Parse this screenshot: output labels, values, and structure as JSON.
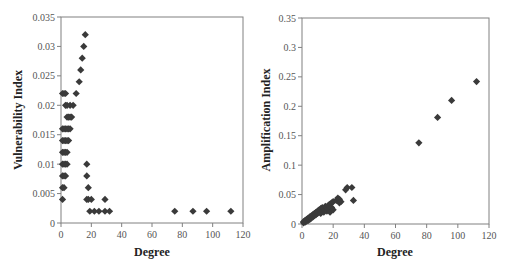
{
  "chart_data": [
    {
      "type": "scatter",
      "title": "",
      "xlabel": "Degree",
      "ylabel": "Vulnerability Index",
      "xlim": [
        0,
        120
      ],
      "ylim": [
        0,
        0.035
      ],
      "xticks": [
        "0",
        "20",
        "40",
        "60",
        "80",
        "100",
        "120"
      ],
      "yticks": [
        "0",
        "0.005",
        "0.01",
        "0.015",
        "0.02",
        "0.025",
        "0.03",
        "0.035"
      ],
      "grid": false,
      "legend": null,
      "marker": "diamond",
      "marker_color": "#3a3a3a",
      "series": [
        {
          "name": "Vulnerability Index",
          "points": [
            [
              16,
              0.032
            ],
            [
              15,
              0.03
            ],
            [
              14,
              0.028
            ],
            [
              13,
              0.026
            ],
            [
              12,
              0.024
            ],
            [
              1,
              0.022
            ],
            [
              2,
              0.022
            ],
            [
              3,
              0.022
            ],
            [
              10,
              0.022
            ],
            [
              3,
              0.02
            ],
            [
              4,
              0.02
            ],
            [
              6,
              0.02
            ],
            [
              8,
              0.02
            ],
            [
              4,
              0.018
            ],
            [
              5,
              0.018
            ],
            [
              6,
              0.018
            ],
            [
              7,
              0.018
            ],
            [
              1,
              0.016
            ],
            [
              2,
              0.016
            ],
            [
              3,
              0.016
            ],
            [
              4,
              0.016
            ],
            [
              5,
              0.016
            ],
            [
              6,
              0.016
            ],
            [
              1,
              0.014
            ],
            [
              2,
              0.014
            ],
            [
              3,
              0.014
            ],
            [
              4,
              0.014
            ],
            [
              5,
              0.014
            ],
            [
              1,
              0.012
            ],
            [
              2,
              0.012
            ],
            [
              3,
              0.012
            ],
            [
              4,
              0.012
            ],
            [
              1,
              0.01
            ],
            [
              2,
              0.01
            ],
            [
              3,
              0.01
            ],
            [
              4,
              0.01
            ],
            [
              17,
              0.01
            ],
            [
              1,
              0.008
            ],
            [
              2,
              0.008
            ],
            [
              3,
              0.008
            ],
            [
              17,
              0.008
            ],
            [
              1,
              0.006
            ],
            [
              2,
              0.006
            ],
            [
              18,
              0.006
            ],
            [
              1,
              0.004
            ],
            [
              17,
              0.004
            ],
            [
              18,
              0.004
            ],
            [
              20,
              0.004
            ],
            [
              29,
              0.004
            ],
            [
              19,
              0.002
            ],
            [
              22,
              0.002
            ],
            [
              25,
              0.002
            ],
            [
              29,
              0.002
            ],
            [
              32,
              0.002
            ],
            [
              75,
              0.002
            ],
            [
              87,
              0.002
            ],
            [
              96,
              0.002
            ],
            [
              112,
              0.002
            ]
          ]
        }
      ]
    },
    {
      "type": "scatter",
      "title": "",
      "xlabel": "Degree",
      "ylabel": "Amplification Index",
      "xlim": [
        0,
        120
      ],
      "ylim": [
        0,
        0.35
      ],
      "xticks": [
        "0",
        "20",
        "40",
        "60",
        "80",
        "100",
        "120"
      ],
      "yticks": [
        "0",
        "0.05",
        "0.1",
        "0.15",
        "0.2",
        "0.25",
        "0.3",
        "0.35"
      ],
      "grid": false,
      "legend": null,
      "marker": "diamond",
      "marker_color": "#3a3a3a",
      "series": [
        {
          "name": "Amplification Index",
          "points": [
            [
              1,
              0.002
            ],
            [
              1,
              0.004
            ],
            [
              2,
              0.003
            ],
            [
              2,
              0.006
            ],
            [
              3,
              0.005
            ],
            [
              3,
              0.008
            ],
            [
              4,
              0.006
            ],
            [
              4,
              0.01
            ],
            [
              5,
              0.008
            ],
            [
              5,
              0.012
            ],
            [
              6,
              0.01
            ],
            [
              6,
              0.014
            ],
            [
              7,
              0.012
            ],
            [
              7,
              0.016
            ],
            [
              8,
              0.014
            ],
            [
              8,
              0.018
            ],
            [
              9,
              0.016
            ],
            [
              9,
              0.02
            ],
            [
              10,
              0.018
            ],
            [
              10,
              0.022
            ],
            [
              11,
              0.02
            ],
            [
              11,
              0.024
            ],
            [
              12,
              0.018
            ],
            [
              12,
              0.026
            ],
            [
              13,
              0.022
            ],
            [
              13,
              0.028
            ],
            [
              14,
              0.02
            ],
            [
              14,
              0.026
            ],
            [
              15,
              0.024
            ],
            [
              15,
              0.03
            ],
            [
              16,
              0.022
            ],
            [
              16,
              0.028
            ],
            [
              17,
              0.026
            ],
            [
              17,
              0.032
            ],
            [
              18,
              0.02
            ],
            [
              18,
              0.034
            ],
            [
              19,
              0.028
            ],
            [
              19,
              0.036
            ],
            [
              20,
              0.024
            ],
            [
              20,
              0.038
            ],
            [
              22,
              0.04
            ],
            [
              23,
              0.044
            ],
            [
              24,
              0.036
            ],
            [
              24,
              0.042
            ],
            [
              25,
              0.038
            ],
            [
              28,
              0.058
            ],
            [
              29,
              0.062
            ],
            [
              32,
              0.062
            ],
            [
              33,
              0.04
            ],
            [
              75,
              0.138
            ],
            [
              87,
              0.181
            ],
            [
              96,
              0.21
            ],
            [
              112,
              0.242
            ]
          ]
        }
      ]
    }
  ],
  "charts": {
    "left": {
      "xlabel": "Degree",
      "ylabel": "Vulnerability Index"
    },
    "right": {
      "xlabel": "Degree",
      "ylabel": "Amplification Index"
    }
  }
}
